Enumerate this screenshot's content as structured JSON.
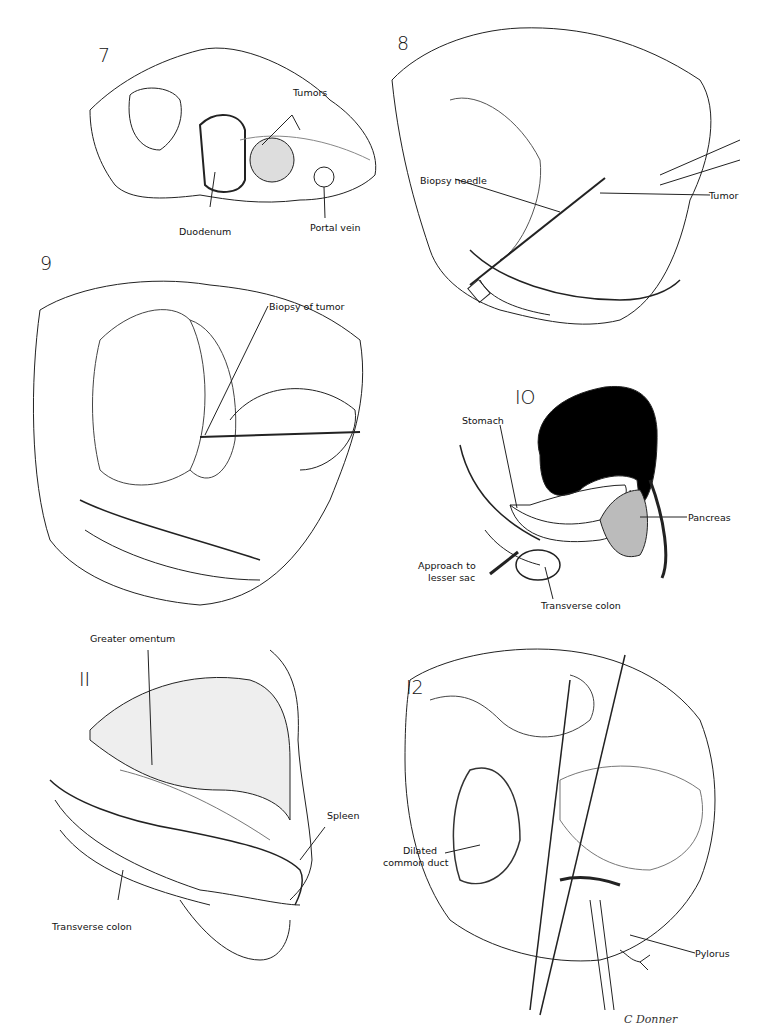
{
  "figures": [
    {
      "number": "7",
      "labels": [
        "Tumors",
        "Duodenum",
        "Portal vein"
      ]
    },
    {
      "number": "8",
      "labels": [
        "Biopsy needle",
        "Tumor"
      ]
    },
    {
      "number": "9",
      "labels": [
        "Biopsy of tumor"
      ]
    },
    {
      "number": "10",
      "labels": [
        "Stomach",
        "Pancreas",
        "Approach to lesser sac",
        "Transverse colon"
      ]
    },
    {
      "number": "11",
      "labels": [
        "Greater omentum",
        "Spleen",
        "Transverse colon"
      ]
    },
    {
      "number": "12",
      "labels": [
        "Dilated common duct",
        "Pylorus"
      ]
    }
  ],
  "fig7": {
    "num": "7",
    "tumors": "Tumors",
    "duodenum": "Duodenum",
    "portal_vein": "Portal vein"
  },
  "fig8": {
    "num": "8",
    "biopsy_needle": "Biopsy needle",
    "tumor": "Tumor"
  },
  "fig9": {
    "num": "9",
    "biopsy_of_tumor": "Biopsy of tumor"
  },
  "fig10": {
    "num": "IO",
    "stomach": "Stomach",
    "pancreas": "Pancreas",
    "approach_1": "Approach to",
    "approach_2": "lesser sac",
    "transverse_colon": "Transverse colon"
  },
  "fig11": {
    "num": "II",
    "greater_omentum": "Greater omentum",
    "spleen": "Spleen",
    "transverse_colon": "Transverse colon"
  },
  "fig12": {
    "num": "I2",
    "dilated_1": "Dilated",
    "dilated_2": "common duct",
    "pylorus": "Pylorus"
  },
  "signature": "C Donner"
}
